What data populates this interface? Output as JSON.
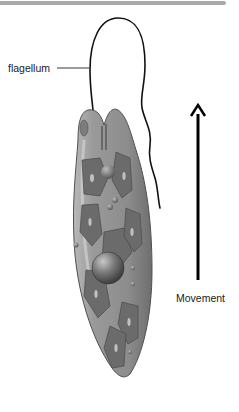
{
  "diagram": {
    "labels": {
      "flagellum": "flagellum",
      "movement": "Movement"
    },
    "colors": {
      "top_bar": "#a9a9a9",
      "cell_body": "#8a8a8a",
      "cell_outline": "#555555",
      "chloroplast": "#6a6a6a",
      "nucleus": "#707070",
      "arrow": "#000000",
      "leader_line": "#222222"
    },
    "annotations": [
      {
        "name": "flagellum",
        "pointer": "leader-line",
        "target": "flagellum"
      },
      {
        "name": "movement",
        "pointer": "upward-arrow",
        "direction": "up"
      }
    ]
  }
}
